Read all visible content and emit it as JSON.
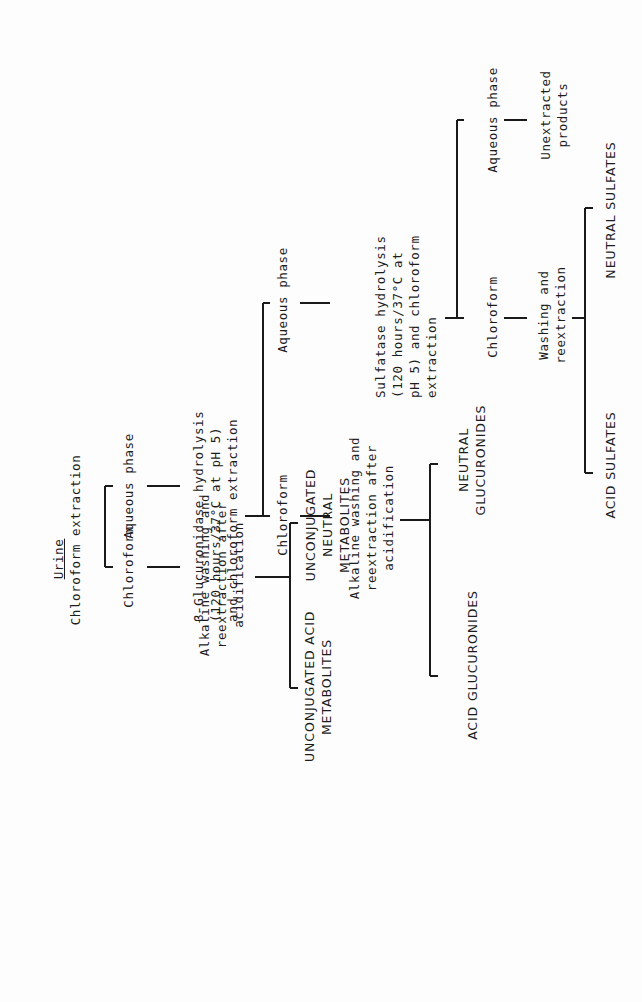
{
  "title": "Urine",
  "nodes": {
    "root_step": "Chloroform extraction",
    "l1_chloroform": "Chloroform",
    "l1_aqueous": "Aqueous phase",
    "l1_alkaline": "Alkaline washing and\nreextraction after\nacidification",
    "unconj_acid": "UNCONJUGATED ACID\nMETABOLITES",
    "unconj_neutral": "UNCONJUGATED\nNEUTRAL\nMETABOLITES",
    "glucuronidase": "β-Glucuronidase hydrolysis\n(120 hours/37°C at pH 5)\nand chloroform extraction",
    "l2_chloroform": "Chloroform",
    "l2_aqueous": "Aqueous phase",
    "l2_alkaline": "Alkaline washing and\nreextraction after\nacidification",
    "acid_glucuronides": "ACID GLUCURONIDES",
    "neutral_glucuronides": "NEUTRAL\nGLUCURONIDES",
    "sulfatase": "Sulfatase hydrolysis\n(120 hours/37°C at\npH 5) and chloroform\nextraction",
    "l3_chloroform": "Chloroform",
    "l3_aqueous": "Aqueous phase",
    "l3_washing": "Washing and\nreextraction",
    "unextracted": "Unextracted\nproducts",
    "acid_sulfates": "ACID SULFATES",
    "neutral_sulfates": "NEUTRAL SULFATES"
  }
}
